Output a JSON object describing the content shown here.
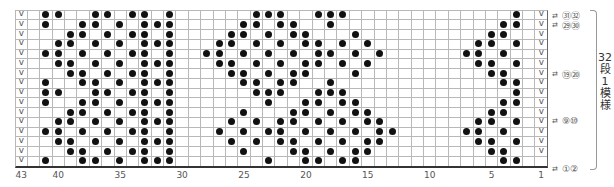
{
  "chart_data": {
    "type": "table",
    "columns": 43,
    "rows": 16,
    "column_numbering": "right-to-left, 1 at right, 43 at left",
    "x_tick_labels": [
      {
        "col": 43,
        "label": "43"
      },
      {
        "col": 40,
        "label": "40"
      },
      {
        "col": 35,
        "label": "35"
      },
      {
        "col": 30,
        "label": "30"
      },
      {
        "col": 25,
        "label": "25"
      },
      {
        "col": 20,
        "label": "20"
      },
      {
        "col": 15,
        "label": "15"
      },
      {
        "col": 10,
        "label": "10"
      },
      {
        "col": 5,
        "label": "5"
      },
      {
        "col": 1,
        "label": "1"
      }
    ],
    "symbols": {
      "dot": "filled circle stitch",
      "slip": "V (slip stitch)"
    },
    "slip_columns": {
      "43": [
        1,
        2,
        3,
        4,
        5,
        6,
        7,
        8,
        9,
        10,
        11,
        12,
        13,
        14,
        15,
        16
      ],
      "1": [
        1,
        2,
        3,
        4,
        5,
        6,
        7,
        8,
        9,
        10,
        11,
        12,
        13,
        14,
        15
      ]
    },
    "dots_by_row_top_to_bottom": [
      [
        41,
        40,
        37,
        36,
        34,
        33,
        31,
        24,
        23,
        22,
        19,
        18,
        17,
        3
      ],
      [
        41,
        38,
        37,
        35,
        33,
        32,
        31,
        25,
        24,
        22,
        21,
        18,
        4,
        3
      ],
      [
        39,
        38,
        36,
        34,
        33,
        31,
        26,
        25,
        23,
        21,
        20,
        16,
        5,
        4
      ],
      [
        40,
        39,
        37,
        35,
        33,
        32,
        31,
        27,
        26,
        24,
        22,
        20,
        19,
        17,
        15,
        6,
        5,
        3
      ],
      [
        41,
        40,
        38,
        36,
        34,
        33,
        31,
        28,
        27,
        25,
        23,
        21,
        19,
        18,
        16,
        14,
        7,
        6,
        4
      ],
      [
        40,
        39,
        37,
        35,
        33,
        32,
        31,
        27,
        26,
        24,
        22,
        20,
        19,
        17,
        15,
        6,
        5,
        3
      ],
      [
        39,
        38,
        36,
        34,
        33,
        31,
        26,
        25,
        23,
        21,
        20,
        16,
        5,
        4
      ],
      [
        41,
        38,
        37,
        35,
        33,
        32,
        31,
        25,
        24,
        22,
        21,
        18,
        4,
        3
      ],
      [
        41,
        40,
        37,
        36,
        34,
        33,
        31,
        24,
        23,
        22,
        19,
        18,
        17,
        3
      ],
      [
        41,
        38,
        37,
        35,
        33,
        32,
        31,
        23,
        20,
        19,
        17,
        16,
        4,
        3
      ],
      [
        39,
        38,
        36,
        34,
        33,
        31,
        25,
        21,
        20,
        18,
        16,
        15,
        5,
        4
      ],
      [
        40,
        39,
        37,
        35,
        33,
        32,
        31,
        26,
        24,
        22,
        21,
        19,
        17,
        15,
        14,
        6,
        5,
        3
      ],
      [
        41,
        40,
        38,
        36,
        34,
        33,
        31,
        27,
        25,
        23,
        22,
        20,
        18,
        16,
        14,
        13,
        7,
        6,
        4
      ],
      [
        40,
        39,
        37,
        35,
        33,
        32,
        31,
        26,
        24,
        22,
        21,
        19,
        17,
        15,
        14,
        6,
        5,
        3
      ],
      [
        39,
        38,
        36,
        34,
        33,
        31,
        25,
        21,
        20,
        18,
        16,
        15,
        5,
        4
      ],
      [
        41,
        38,
        37,
        35,
        33,
        32,
        31,
        23,
        20,
        19,
        17,
        16,
        4,
        3
      ]
    ],
    "row_annotations": [
      {
        "row": 1,
        "arrows": "⇄",
        "label": "㉛㉜"
      },
      {
        "row": 2,
        "arrows": "⇄",
        "label": "㉙㉚"
      },
      {
        "row": 7,
        "arrows": "⇄",
        "label": "⑲⑳"
      },
      {
        "row": 12,
        "arrows": "⇄",
        "label": "⑨⑩"
      },
      {
        "row": 16,
        "arrows": "⇄",
        "label": "①②"
      }
    ],
    "repeat_label": "32段1模様"
  },
  "legend": {
    "repeat_label": "32\n段\n1\n模\n様"
  },
  "colors": {
    "dot": "#111111",
    "grid_line": "#b8b8b8",
    "text": "#555555"
  }
}
